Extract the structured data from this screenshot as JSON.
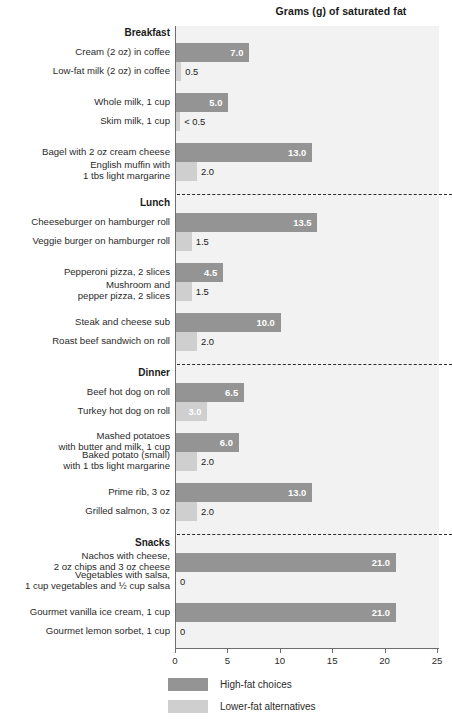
{
  "chart_data": {
    "type": "bar",
    "title": "Grams (g) of saturated fat",
    "xlabel": "",
    "ylabel": "",
    "xlim": [
      0,
      25
    ],
    "orientation": "horizontal",
    "grid": false,
    "legend_position": "bottom-left",
    "xticks": [
      "0",
      "5",
      "10",
      "15",
      "20",
      "25"
    ],
    "xtick_values": [
      0,
      5,
      10,
      15,
      20,
      25
    ],
    "legend": [
      {
        "name": "High-fat choices",
        "color": "#949494"
      },
      {
        "name": "Lower-fat alternatives",
        "color": "#cfcfcf"
      }
    ],
    "sections": [
      {
        "header": "Breakfast",
        "pairs": [
          {
            "high": {
              "label": "Cream (2 oz) in coffee",
              "value": 7.0,
              "value_label": "7.0"
            },
            "low": {
              "label": "Low-fat milk (2 oz) in coffee",
              "value": 0.5,
              "value_label": "0.5"
            }
          },
          {
            "high": {
              "label": "Whole milk, 1 cup",
              "value": 5.0,
              "value_label": "5.0"
            },
            "low": {
              "label": "Skim milk, 1 cup",
              "value": 0.4,
              "value_label": "< 0.5"
            }
          },
          {
            "high": {
              "label": "Bagel with 2 oz cream cheese",
              "value": 13.0,
              "value_label": "13.0"
            },
            "low": {
              "label": "English muffin with\n1 tbs light margarine",
              "value": 2.0,
              "value_label": "2.0"
            }
          }
        ]
      },
      {
        "header": "Lunch",
        "pairs": [
          {
            "high": {
              "label": "Cheeseburger on hamburger roll",
              "value": 13.5,
              "value_label": "13.5"
            },
            "low": {
              "label": "Veggie burger on hamburger roll",
              "value": 1.5,
              "value_label": "1.5"
            }
          },
          {
            "high": {
              "label": "Pepperoni pizza, 2 slices",
              "value": 4.5,
              "value_label": "4.5"
            },
            "low": {
              "label": "Mushroom and\npepper pizza, 2 slices",
              "value": 1.5,
              "value_label": "1.5"
            }
          },
          {
            "high": {
              "label": "Steak and cheese sub",
              "value": 10.0,
              "value_label": "10.0"
            },
            "low": {
              "label": "Roast beef sandwich on roll",
              "value": 2.0,
              "value_label": "2.0"
            }
          }
        ]
      },
      {
        "header": "Dinner",
        "pairs": [
          {
            "high": {
              "label": "Beef hot dog on roll",
              "value": 6.5,
              "value_label": "6.5"
            },
            "low": {
              "label": "Turkey hot dog on roll",
              "value": 3.0,
              "value_label": "3.0"
            }
          },
          {
            "high": {
              "label": "Mashed potatoes\nwith butter and milk, 1 cup",
              "value": 6.0,
              "value_label": "6.0"
            },
            "low": {
              "label": "Baked potato (small)\nwith 1 tbs light margarine",
              "value": 2.0,
              "value_label": "2.0"
            }
          },
          {
            "high": {
              "label": "Prime rib, 3 oz",
              "value": 13.0,
              "value_label": "13.0"
            },
            "low": {
              "label": "Grilled salmon, 3 oz",
              "value": 2.0,
              "value_label": "2.0"
            }
          }
        ]
      },
      {
        "header": "Snacks",
        "pairs": [
          {
            "high": {
              "label": "Nachos with cheese,\n2 oz chips and 3 oz cheese",
              "value": 21.0,
              "value_label": "21.0"
            },
            "low": {
              "label": "Vegetables with salsa,\n1 cup vegetables and ½ cup salsa",
              "value": 0,
              "value_label": "0"
            }
          },
          {
            "high": {
              "label": "Gourmet vanilla ice cream, 1 cup",
              "value": 21.0,
              "value_label": "21.0"
            },
            "low": {
              "label": "Gourmet lemon sorbet, 1 cup",
              "value": 0,
              "value_label": "0"
            }
          }
        ]
      }
    ]
  },
  "colors": {
    "high_fat": "#949494",
    "lower_fat": "#cfcfcf",
    "plot_background": "#f2f2f2",
    "axis": "#6e6e6e",
    "text": "#2b2b2b"
  }
}
